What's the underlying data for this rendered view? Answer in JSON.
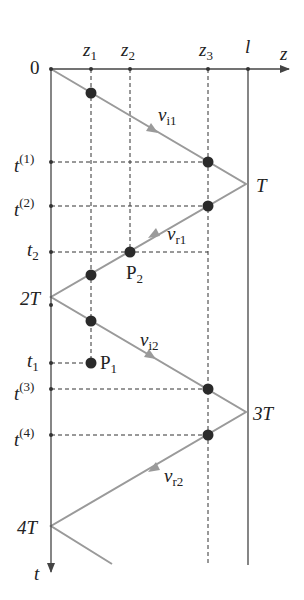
{
  "axes": {
    "horizontal": {
      "label": "z",
      "origin_label": "0"
    },
    "vertical": {
      "label": "t"
    }
  },
  "z_ticks": [
    {
      "name": "z",
      "sub": "1",
      "x": 91
    },
    {
      "name": "z",
      "sub": "2",
      "x": 130
    },
    {
      "name": "z",
      "sub": "3",
      "x": 208
    },
    {
      "name": "l",
      "sub": "",
      "x": 248
    }
  ],
  "t_ticks": [
    {
      "name": "t",
      "sup": "(1)",
      "y": 162
    },
    {
      "name": "t",
      "sup": "(2)",
      "y": 206
    },
    {
      "name": "t",
      "sub": "2",
      "y": 252
    },
    {
      "name": "t",
      "sub": "1",
      "y": 363
    },
    {
      "name": "t",
      "sup": "(3)",
      "y": 389
    },
    {
      "name": "t",
      "sup": "(4)",
      "y": 435
    }
  ],
  "time_marks": [
    {
      "label": "T",
      "y": 184
    },
    {
      "label": "2T",
      "y": 297
    },
    {
      "label": "3T",
      "y": 412
    },
    {
      "label": "4T",
      "y": 526
    }
  ],
  "velocity_labels": [
    {
      "name": "v",
      "sub": "i1"
    },
    {
      "name": "v",
      "sub": "r1"
    },
    {
      "name": "v",
      "sub": "i2"
    },
    {
      "name": "v",
      "sub": "r2"
    }
  ],
  "points": [
    {
      "label": "P",
      "sub": "1"
    },
    {
      "label": "P",
      "sub": "2"
    }
  ],
  "colors": {
    "axis": "#444444",
    "wave_line": "#9a9a9a",
    "dot": "#2a2a2a",
    "dashed": "#333333"
  }
}
